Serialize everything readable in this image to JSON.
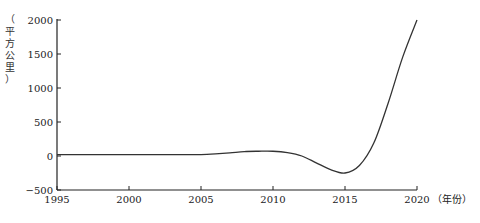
{
  "chart_data": {
    "type": "line",
    "title": "",
    "xlabel": "（年份）",
    "ylabel": "（平方公里）",
    "x": [
      1995,
      1996,
      1997,
      1998,
      1999,
      2000,
      2001,
      2002,
      2003,
      2004,
      2005,
      2006,
      2007,
      2008,
      2009,
      2010,
      2011,
      2012,
      2013,
      2014,
      2015,
      2016,
      2017,
      2018,
      2019,
      2020
    ],
    "series": [
      {
        "name": "",
        "values": [
          20,
          20,
          20,
          20,
          20,
          20,
          20,
          20,
          20,
          20,
          20,
          30,
          45,
          65,
          70,
          70,
          50,
          0,
          -100,
          -200,
          -250,
          -140,
          190,
          780,
          1450,
          2000
        ]
      }
    ],
    "xticks": [
      "1995",
      "2000",
      "2005",
      "2010",
      "2015",
      "2020"
    ],
    "yticks": [
      "2000",
      "1500",
      "1000",
      "500",
      "0",
      "-500"
    ],
    "xlim": [
      1995,
      2020
    ],
    "ylim": [
      -500,
      2000
    ],
    "grid": false,
    "legend": null,
    "line_color": "#333333"
  },
  "labels": {
    "y_axis_chars": [
      "（",
      "平",
      "方",
      "公",
      "里",
      "）"
    ],
    "x_axis_unit": "（年份）"
  }
}
